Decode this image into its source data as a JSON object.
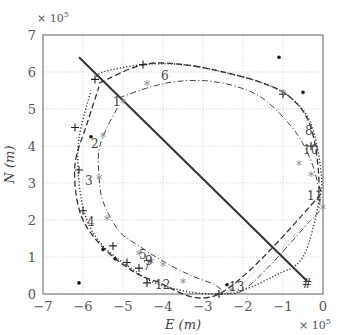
{
  "chart_data": {
    "type": "line",
    "title": "",
    "xlabel": "E (m)",
    "ylabel": "N (m)",
    "x_multiplier": "× 10^5",
    "y_multiplier": "× 10^5",
    "xlim": [
      -7,
      0
    ],
    "ylim": [
      0,
      7
    ],
    "x_ticks": [
      "-7",
      "-6",
      "-5",
      "-4",
      "-3",
      "-2",
      "-1",
      "0"
    ],
    "y_ticks": [
      "0",
      "1",
      "2",
      "3",
      "4",
      "5",
      "6",
      "7"
    ],
    "grid": true,
    "legend": null,
    "series": [
      {
        "name": "straight track (solid)",
        "style": "solid",
        "x": [
          -6.1,
          -0.4
        ],
        "y": [
          6.4,
          0.35
        ]
      },
      {
        "name": "outer orbit (dotted)",
        "style": "dotted",
        "x": [
          -5.7,
          -5.5,
          -4.5,
          -3.5,
          -2.5,
          -1.5,
          -0.8,
          -0.3,
          -0.05,
          -0.1,
          -0.5,
          -1.2,
          -2.0,
          -2.5,
          -3.3,
          -4.2,
          -4.8,
          -5.5,
          -5.9,
          -6.1,
          -6.1,
          -5.8
        ],
        "y": [
          5.8,
          6.0,
          6.2,
          6.2,
          6.0,
          5.7,
          5.3,
          4.6,
          3.3,
          2.5,
          1.0,
          0.5,
          0.1,
          0.0,
          0.05,
          0.3,
          0.7,
          1.3,
          2.0,
          3.0,
          4.2,
          5.5
        ]
      },
      {
        "name": "outer orbit (dashed)",
        "style": "dashed",
        "x": [
          -5.6,
          -4.5,
          -3.5,
          -2.5,
          -1.5,
          -0.8,
          -0.3,
          -0.1,
          -0.3,
          -2.6,
          -4.2,
          -5.0,
          -5.7,
          -6.1,
          -6.2,
          -5.9,
          -5.6
        ],
        "y": [
          5.7,
          6.2,
          6.2,
          6.0,
          5.7,
          5.3,
          4.5,
          3.0,
          2.4,
          0.0,
          0.35,
          0.8,
          1.5,
          2.3,
          3.5,
          4.6,
          5.6
        ]
      },
      {
        "name": "inner orbit (dash-dot)",
        "style": "dashdot",
        "x": [
          -5.1,
          -4.3,
          -3.6,
          -2.8,
          -2.0,
          -1.4,
          -0.7,
          -0.3,
          -0.1,
          -0.1,
          -0.3,
          -2.0,
          -2.8,
          -3.5,
          -4.1,
          -4.6,
          -5.1,
          -5.5,
          -5.6,
          -5.6,
          -5.4,
          -5.1
        ],
        "y": [
          5.3,
          5.6,
          5.75,
          5.75,
          5.55,
          5.2,
          4.4,
          3.6,
          2.8,
          2.3,
          2.0,
          0.1,
          0.3,
          0.6,
          0.95,
          1.3,
          1.7,
          2.5,
          3.2,
          3.9,
          4.5,
          5.1
        ]
      },
      {
        "name": "transfer link (thin dotted)",
        "style": "thin-dotted",
        "x": [
          -2.3,
          0.0
        ],
        "y": [
          0.0,
          2.3
        ]
      }
    ],
    "markers": [
      {
        "symbol": "+",
        "x": -5.7,
        "y": 5.8
      },
      {
        "symbol": "+",
        "x": -4.5,
        "y": 6.2
      },
      {
        "symbol": "+",
        "x": -6.2,
        "y": 4.5
      },
      {
        "symbol": "+",
        "x": -6.1,
        "y": 3.35
      },
      {
        "symbol": "+",
        "x": -6.0,
        "y": 2.25
      },
      {
        "symbol": "+",
        "x": -5.25,
        "y": 1.3
      },
      {
        "symbol": "+",
        "x": -4.9,
        "y": 0.85
      },
      {
        "symbol": "+",
        "x": -4.6,
        "y": 0.7
      },
      {
        "symbol": "+",
        "x": -4.4,
        "y": 0.3
      },
      {
        "symbol": "+",
        "x": -2.6,
        "y": 0.0
      },
      {
        "symbol": "+",
        "x": -1.0,
        "y": 5.4
      },
      {
        "symbol": "+",
        "x": -0.3,
        "y": 4.0
      },
      {
        "symbol": "#",
        "x": -0.4,
        "y": 0.3
      },
      {
        "symbol": "*",
        "x": -5.0,
        "y": 5.15
      },
      {
        "symbol": "*",
        "x": -4.4,
        "y": 5.65
      },
      {
        "symbol": "*",
        "x": -5.5,
        "y": 4.25
      },
      {
        "symbol": "*",
        "x": -5.6,
        "y": 3.1
      },
      {
        "symbol": "*",
        "x": -5.4,
        "y": 2.0
      },
      {
        "symbol": "*",
        "x": -4.6,
        "y": 1.05
      },
      {
        "symbol": "*",
        "x": -4.3,
        "y": 0.85
      },
      {
        "symbol": "*",
        "x": -4.0,
        "y": 0.75
      },
      {
        "symbol": "*",
        "x": -3.5,
        "y": 0.3
      },
      {
        "symbol": "*",
        "x": -1.0,
        "y": 5.4
      },
      {
        "symbol": "*",
        "x": -0.6,
        "y": 3.5
      },
      {
        "symbol": "*",
        "x": -0.3,
        "y": 3.2
      },
      {
        "symbol": "*",
        "x": 0.0,
        "y": 2.3
      },
      {
        "symbol": "*",
        "x": -2.3,
        "y": 0.05
      },
      {
        "symbol": "•",
        "x": -1.1,
        "y": 6.4
      },
      {
        "symbol": "•",
        "x": -0.5,
        "y": 5.45
      },
      {
        "symbol": "•",
        "x": -5.8,
        "y": 4.25
      },
      {
        "symbol": "•",
        "x": -5.5,
        "y": 1.2
      },
      {
        "symbol": "•",
        "x": -5.2,
        "y": 0.95
      },
      {
        "symbol": "•",
        "x": -6.1,
        "y": 0.3
      },
      {
        "symbol": "•",
        "x": -2.4,
        "y": 0.25
      }
    ],
    "annotations": [
      {
        "text": "1",
        "x": -5.25,
        "y": 5.2
      },
      {
        "text": "2",
        "x": -5.8,
        "y": 4.05
      },
      {
        "text": "3",
        "x": -5.95,
        "y": 3.05
      },
      {
        "text": "4",
        "x": -5.9,
        "y": 1.95
      },
      {
        "text": "5",
        "x": -4.6,
        "y": 1.05
      },
      {
        "text": "6",
        "x": -4.05,
        "y": 5.9
      },
      {
        "text": "7",
        "x": -4.5,
        "y": 0.75
      },
      {
        "text": "8",
        "x": -0.45,
        "y": 4.4
      },
      {
        "text": "9",
        "x": -4.45,
        "y": 0.88
      },
      {
        "text": "10",
        "x": -0.5,
        "y": 3.9
      },
      {
        "text": "11",
        "x": -0.4,
        "y": 2.65
      },
      {
        "text": "12",
        "x": -4.2,
        "y": 0.25
      },
      {
        "text": "13",
        "x": -2.35,
        "y": 0.2
      }
    ]
  }
}
